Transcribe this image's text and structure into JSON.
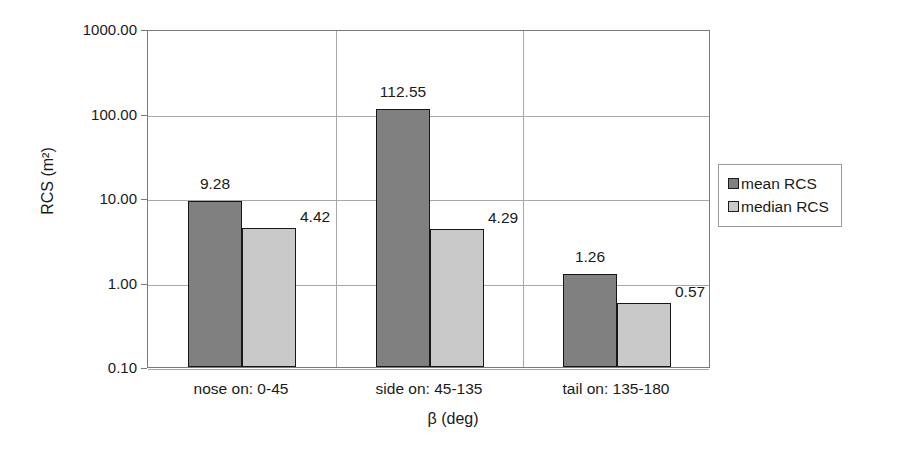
{
  "chart_data": {
    "type": "bar",
    "title": "",
    "xlabel": "β (deg)",
    "ylabel": "RCS (m²)",
    "yscale": "log",
    "ylim": [
      0.1,
      1000.0
    ],
    "ytick_labels": [
      "1000.00",
      "100.00",
      "10.00",
      "1.00",
      "0.10"
    ],
    "ytick_values": [
      1000.0,
      100.0,
      10.0,
      1.0,
      0.1
    ],
    "grid": true,
    "legend_position": "right",
    "categories": [
      "nose on:  0-45",
      "side on: 45-135",
      "tail on: 135-180"
    ],
    "series": [
      {
        "name": "mean RCS",
        "color": "#808080",
        "values": [
          9.28,
          112.55,
          1.26
        ]
      },
      {
        "name": "median RCS",
        "color": "#c9c9c9",
        "values": [
          4.42,
          4.29,
          0.57
        ]
      }
    ],
    "data_labels": [
      "9.28",
      "4.42",
      "112.55",
      "4.29",
      "1.26",
      "0.57"
    ]
  },
  "legend": {
    "items": [
      {
        "label": "mean RCS"
      },
      {
        "label": "median RCS"
      }
    ]
  },
  "axes": {
    "y_title": "RCS (m²)",
    "x_title": "β (deg)",
    "y_ticks": [
      "1000.00",
      "100.00",
      "10.00",
      "1.00",
      "0.10"
    ],
    "x_ticks": [
      "nose on:  0-45",
      "side on: 45-135",
      "tail on: 135-180"
    ]
  }
}
